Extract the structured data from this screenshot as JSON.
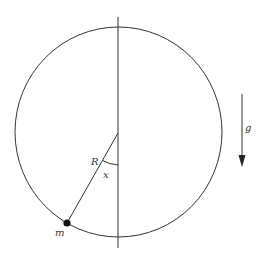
{
  "diagram": {
    "labels": {
      "radius": "R",
      "angle": "x",
      "mass": "m",
      "gravity": "g"
    },
    "colors": {
      "stroke": "#333333",
      "mass_fill": "#111111",
      "background": "#ffffff"
    }
  }
}
